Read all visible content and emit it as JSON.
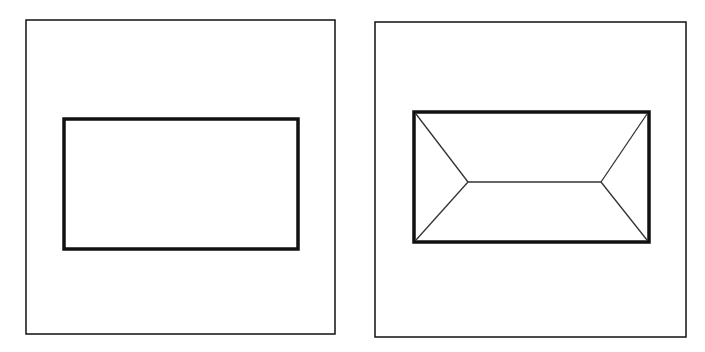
{
  "diagram": {
    "type": "plan-view-figures",
    "background": "#ffffff",
    "stroke_color": "#111111",
    "panels": [
      {
        "name": "left",
        "frame": {
          "x": 26,
          "y": 20,
          "w": 309,
          "h": 314,
          "stroke_width": 1.5
        },
        "rect": {
          "x": 64,
          "y": 119,
          "w": 234,
          "h": 130,
          "stroke_width": 3.5
        },
        "lines": []
      },
      {
        "name": "right",
        "frame": {
          "x": 375,
          "y": 22,
          "w": 311,
          "h": 315,
          "stroke_width": 1.5
        },
        "rect": {
          "x": 414,
          "y": 112,
          "w": 235,
          "h": 130,
          "stroke_width": 3.5
        },
        "lines": [
          {
            "x1": 416,
            "y1": 114,
            "x2": 468,
            "y2": 182
          },
          {
            "x1": 416,
            "y1": 240,
            "x2": 468,
            "y2": 182
          },
          {
            "x1": 468,
            "y1": 182,
            "x2": 601,
            "y2": 182
          },
          {
            "x1": 647,
            "y1": 114,
            "x2": 601,
            "y2": 182
          },
          {
            "x1": 647,
            "y1": 240,
            "x2": 601,
            "y2": 182
          }
        ]
      }
    ]
  }
}
